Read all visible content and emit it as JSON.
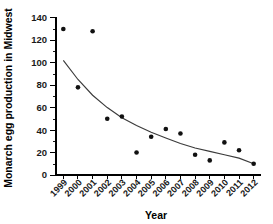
{
  "chart_data": {
    "type": "scatter",
    "title": "",
    "xlabel": "Year",
    "ylabel": "Monarch egg production in Midwest",
    "categories": [
      "1999",
      "2000",
      "2001",
      "2002",
      "2003",
      "2004",
      "2005",
      "2006",
      "2007",
      "2008",
      "2009",
      "2010",
      "2011",
      "2012"
    ],
    "x": [
      1999,
      2000,
      2001,
      2002,
      2003,
      2004,
      2005,
      2006,
      2007,
      2008,
      2009,
      2010,
      2011,
      2012
    ],
    "values": [
      130,
      78,
      128,
      50,
      52,
      20,
      34,
      41,
      37,
      18,
      13,
      29,
      22,
      10
    ],
    "series": [
      {
        "name": "Monarch egg production",
        "values": [
          130,
          78,
          128,
          50,
          52,
          20,
          34,
          41,
          37,
          18,
          13,
          29,
          22,
          10
        ]
      },
      {
        "name": "Exponential decline trend",
        "values": [
          102,
          85,
          71,
          60,
          51,
          44,
          38,
          33,
          28,
          24,
          21,
          18,
          15,
          10
        ]
      }
    ],
    "xlim": [
      1998.5,
      2012.5
    ],
    "ylim": [
      0,
      140
    ],
    "ytick_labels": [
      "0",
      "20",
      "40",
      "60",
      "80",
      "100",
      "120",
      "140"
    ],
    "yticks": [
      0,
      20,
      40,
      60,
      80,
      100,
      120,
      140
    ],
    "y_minor_ticks": [
      10,
      30,
      50,
      70,
      90,
      110,
      130
    ],
    "grid": false,
    "legend": "none",
    "point_color": "#111111",
    "trend_color": "#3b3b3b",
    "axis_color": "#000000",
    "background_color": "#ffffff"
  },
  "axes": {
    "y_title": "Monarch egg production in Midwest",
    "x_title": "Year"
  }
}
